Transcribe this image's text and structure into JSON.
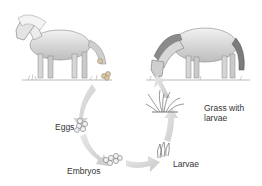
{
  "diagram": {
    "type": "life-cycle",
    "stages": [
      {
        "id": "adult-horse",
        "label": ""
      },
      {
        "id": "eggs",
        "label": "Eggs"
      },
      {
        "id": "embryos",
        "label": "Embryos"
      },
      {
        "id": "larvae",
        "label": "Larvae"
      },
      {
        "id": "grass",
        "label": "Grass with\nlarvae"
      },
      {
        "id": "grazing-horse",
        "label": ""
      }
    ],
    "labels": {
      "eggs": "Eggs",
      "embryos": "Embryos",
      "larvae": "Larvae",
      "grass_line1": "Grass with",
      "grass_line2": "larvae"
    },
    "colors": {
      "arrow": "#d4d4d4",
      "ink": "#555555",
      "text": "#333333",
      "background": "#ffffff"
    }
  }
}
